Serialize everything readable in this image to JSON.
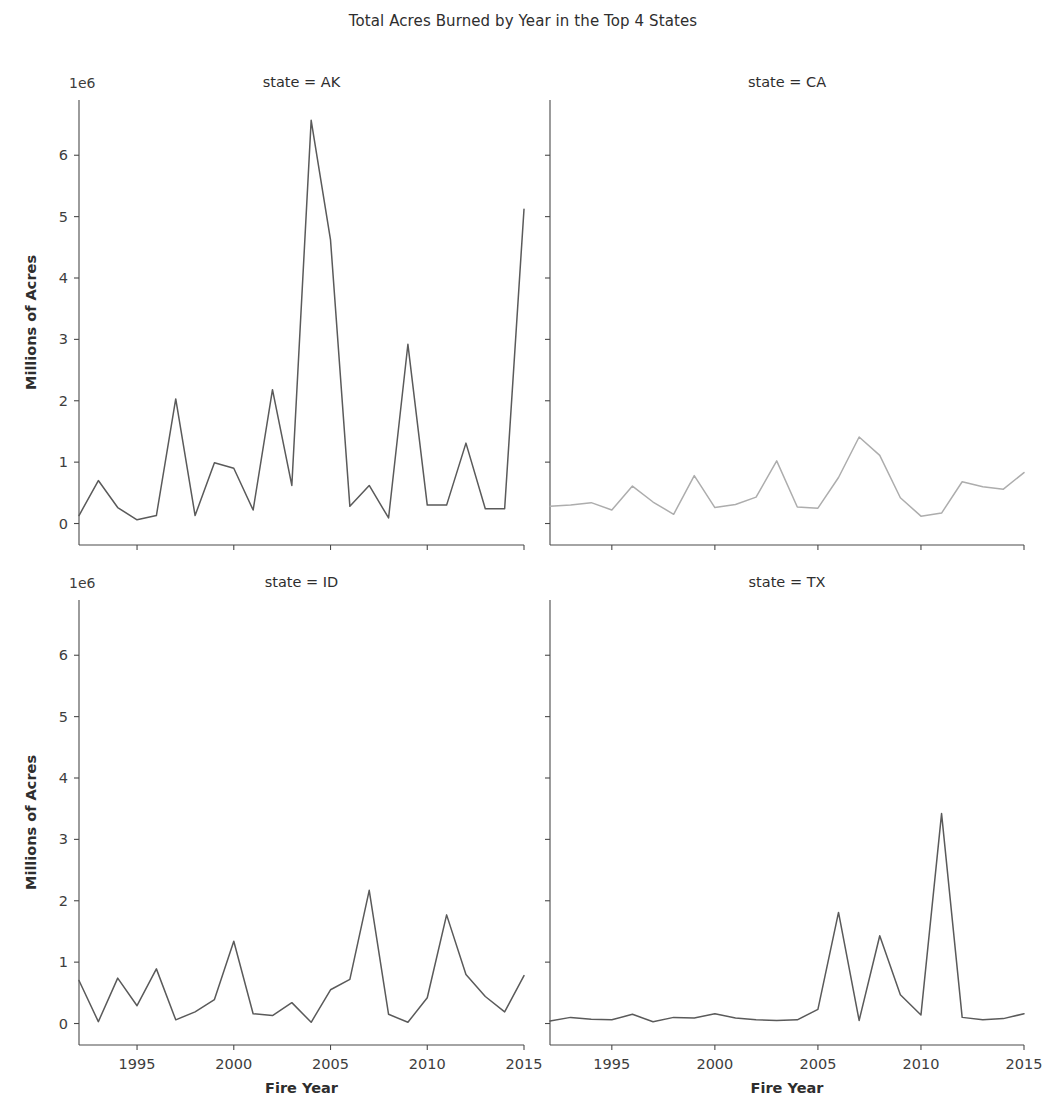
{
  "figure": {
    "title": "Total Acres Burned by Year in the Top 4 States",
    "xlabel": "Fire Year",
    "ylabel": "Millions of Acres",
    "offset_label": "1e6",
    "background": "#ffffff"
  },
  "chart_data": {
    "type": "line",
    "title": "Total Acres Burned by Year in the Top 4 States",
    "xlabel": "Fire Year",
    "ylabel": "Millions of Acres",
    "offset": "1e6",
    "grid": false,
    "legend": "none",
    "layout": "2x2 facet grid, shared x and y axes",
    "xlim": [
      1992,
      2015
    ],
    "ylim": [
      -0.35,
      6.9
    ],
    "xticks": [
      1995,
      2000,
      2005,
      2010,
      2015
    ],
    "yticks": [
      0,
      1,
      2,
      3,
      4,
      5,
      6
    ],
    "ytick_labels": [
      "0",
      "1",
      "2",
      "3",
      "4",
      "5",
      "6"
    ],
    "xtick_labels": [
      "1995",
      "2000",
      "2005",
      "2010",
      "2015"
    ],
    "x": [
      1992,
      1993,
      1994,
      1995,
      1996,
      1997,
      1998,
      1999,
      2000,
      2001,
      2002,
      2003,
      2004,
      2005,
      2006,
      2007,
      2008,
      2009,
      2010,
      2011,
      2012,
      2013,
      2014,
      2015
    ],
    "panels": [
      {
        "title": "state = AK",
        "facet_key": "state",
        "facet_value": "AK",
        "color": "#5a5a5a",
        "row": 0,
        "col": 0,
        "values": [
          0.13,
          0.7,
          0.26,
          0.06,
          0.13,
          2.03,
          0.13,
          0.99,
          0.9,
          0.22,
          2.18,
          0.62,
          6.57,
          4.62,
          0.28,
          0.62,
          0.09,
          2.92,
          0.3,
          0.3,
          1.31,
          0.24,
          0.24,
          5.12
        ],
        "units": "acres (millions)"
      },
      {
        "title": "state = CA",
        "facet_key": "state",
        "facet_value": "CA",
        "color": "#adadad",
        "row": 0,
        "col": 1,
        "values": [
          0.28,
          0.3,
          0.34,
          0.22,
          0.61,
          0.35,
          0.15,
          0.78,
          0.26,
          0.31,
          0.43,
          1.02,
          0.27,
          0.25,
          0.75,
          1.41,
          1.11,
          0.42,
          0.12,
          0.17,
          0.68,
          0.6,
          0.56,
          0.83
        ],
        "units": "acres (millions)"
      },
      {
        "title": "state = ID",
        "facet_key": "state",
        "facet_value": "ID",
        "color": "#5a5a5a",
        "row": 1,
        "col": 0,
        "values": [
          0.7,
          0.03,
          0.74,
          0.29,
          0.89,
          0.06,
          0.19,
          0.39,
          1.34,
          0.16,
          0.13,
          0.34,
          0.02,
          0.55,
          0.72,
          2.17,
          0.15,
          0.02,
          0.42,
          1.77,
          0.8,
          0.44,
          0.19,
          0.78
        ],
        "units": "acres (millions)"
      },
      {
        "title": "state = TX",
        "facet_key": "state",
        "facet_value": "TX",
        "color": "#5a5a5a",
        "row": 1,
        "col": 1,
        "values": [
          0.04,
          0.1,
          0.07,
          0.06,
          0.15,
          0.03,
          0.1,
          0.09,
          0.16,
          0.09,
          0.06,
          0.05,
          0.06,
          0.23,
          1.81,
          0.05,
          1.43,
          0.47,
          0.14,
          3.42,
          0.1,
          0.06,
          0.08,
          0.16
        ],
        "units": "acres (millions)"
      }
    ]
  }
}
